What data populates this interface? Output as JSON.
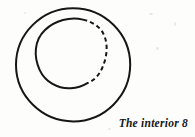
{
  "figure": {
    "caption": "The interior 8",
    "background_color": "#fdfdfc",
    "ink_color": "#161616",
    "outer_circle": {
      "name": "outer-circle",
      "style": "solid",
      "cx": 73,
      "cy": 65,
      "r": 57,
      "stroke_width": 2.0
    },
    "inner_circle": {
      "name": "inner-circle",
      "cx": 70,
      "cy": 53,
      "r": 35,
      "stroke_width": 2.0,
      "solid_arc_label": "left-and-bottom-arc",
      "dashed_arc_label": "right-and-top-arc",
      "dash_pattern": "4.2 3.2"
    }
  }
}
